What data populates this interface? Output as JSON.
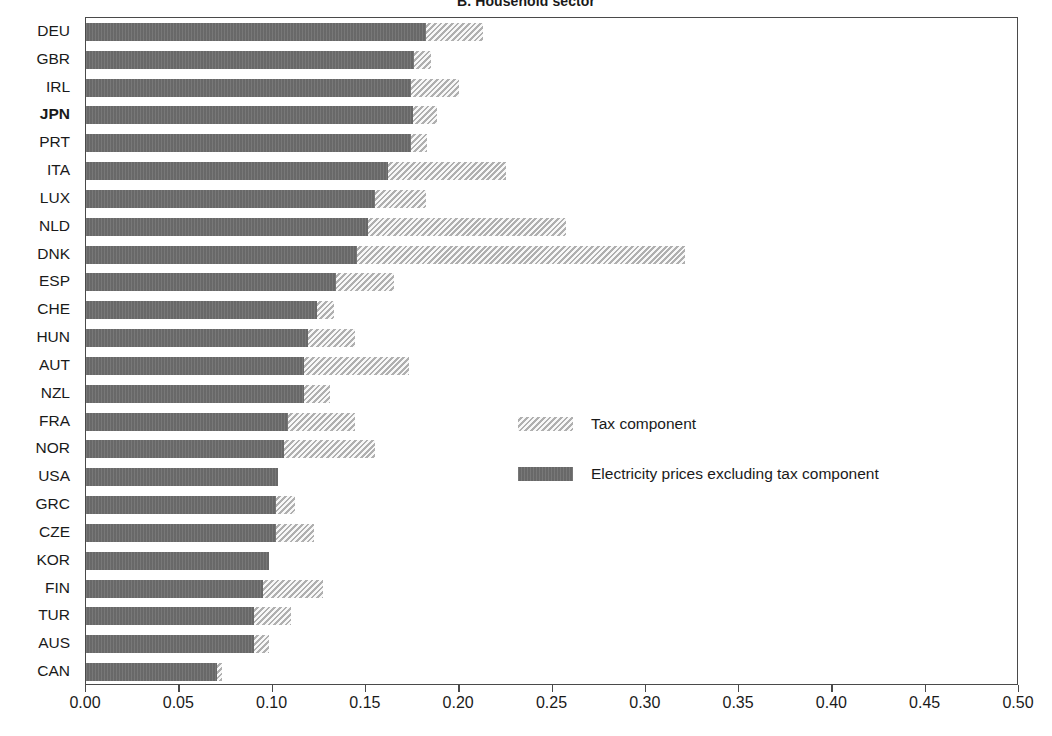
{
  "chart_data": {
    "type": "bar",
    "orientation": "horizontal",
    "stacked": true,
    "title": "B. Household sector",
    "xlabel": "",
    "ylabel": "",
    "xlim": [
      0.0,
      0.5
    ],
    "xticks": [
      "0.00",
      "0.05",
      "0.10",
      "0.15",
      "0.20",
      "0.25",
      "0.30",
      "0.35",
      "0.40",
      "0.45",
      "0.50"
    ],
    "xtick_values": [
      0.0,
      0.05,
      0.1,
      0.15,
      0.2,
      0.25,
      0.3,
      0.35,
      0.4,
      0.45,
      0.5
    ],
    "grid": false,
    "legend_position": "center",
    "highlight_category": "JPN",
    "categories": [
      "DEU",
      "GBR",
      "IRL",
      "JPN",
      "PRT",
      "ITA",
      "LUX",
      "NLD",
      "DNK",
      "ESP",
      "CHE",
      "HUN",
      "AUT",
      "NZL",
      "FRA",
      "NOR",
      "USA",
      "GRC",
      "CZE",
      "KOR",
      "FIN",
      "TUR",
      "AUS",
      "CAN"
    ],
    "series": [
      {
        "name": "Electricity prices excluding tax component",
        "color": "#6e6e6e",
        "values": [
          0.182,
          0.176,
          0.174,
          0.175,
          0.174,
          0.162,
          0.155,
          0.151,
          0.145,
          0.134,
          0.124,
          0.119,
          0.117,
          0.117,
          0.108,
          0.106,
          0.103,
          0.102,
          0.102,
          0.098,
          0.095,
          0.09,
          0.09,
          0.07
        ]
      },
      {
        "name": "Tax component",
        "color": "#cfcfcf",
        "values": [
          0.031,
          0.009,
          0.026,
          0.013,
          0.009,
          0.063,
          0.027,
          0.106,
          0.176,
          0.031,
          0.009,
          0.025,
          0.056,
          0.014,
          0.036,
          0.049,
          0.0,
          0.01,
          0.02,
          0.0,
          0.032,
          0.02,
          0.008,
          0.003
        ]
      }
    ],
    "totals": [
      0.213,
      0.185,
      0.2,
      0.188,
      0.183,
      0.225,
      0.182,
      0.257,
      0.321,
      0.165,
      0.133,
      0.144,
      0.173,
      0.131,
      0.144,
      0.155,
      0.103,
      0.112,
      0.122,
      0.098,
      0.127,
      0.11,
      0.098,
      0.073
    ]
  },
  "legend": {
    "entries": [
      {
        "label": "Tax component",
        "swatch": "tax-swatch"
      },
      {
        "label": "Electricity prices excluding tax component",
        "swatch": "base-swatch"
      }
    ]
  }
}
